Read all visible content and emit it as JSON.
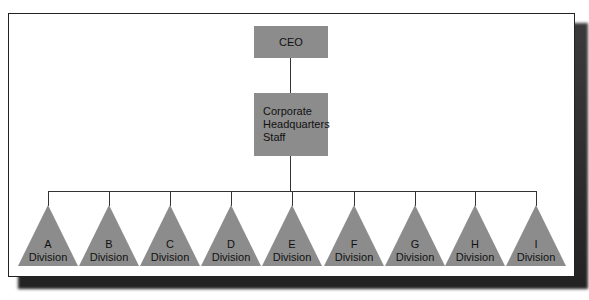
{
  "chart": {
    "top": {
      "label": "CEO"
    },
    "staff": {
      "line1": "Corporate",
      "line2": "Headquarters",
      "line3": "Staff"
    },
    "divisions": [
      {
        "letter": "A",
        "label": "Division"
      },
      {
        "letter": "B",
        "label": "Division"
      },
      {
        "letter": "C",
        "label": "Division"
      },
      {
        "letter": "D",
        "label": "Division"
      },
      {
        "letter": "E",
        "label": "Division"
      },
      {
        "letter": "F",
        "label": "Division"
      },
      {
        "letter": "G",
        "label": "Division"
      },
      {
        "letter": "H",
        "label": "Division"
      },
      {
        "letter": "I",
        "label": "Division"
      }
    ],
    "colors": {
      "node_fill": "#8c8c8c",
      "line": "#333333",
      "frame": "#222222"
    }
  }
}
